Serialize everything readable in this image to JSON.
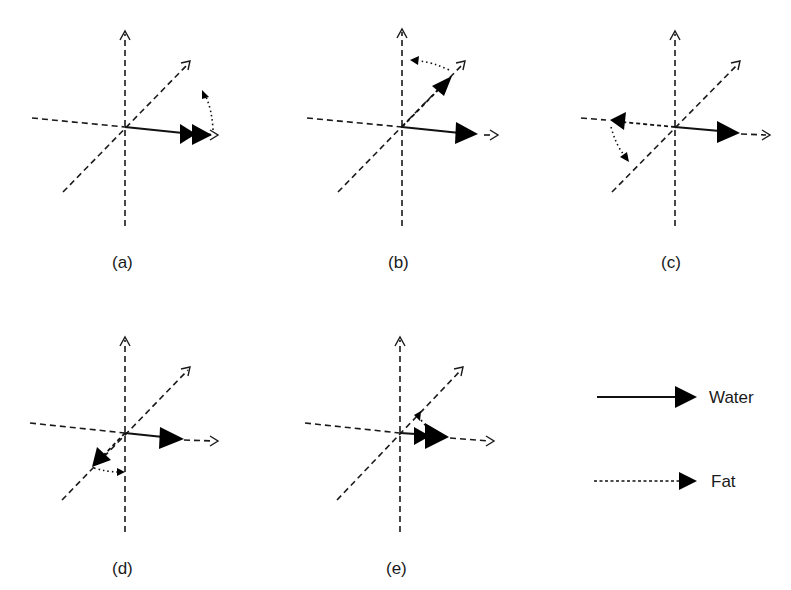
{
  "figure": {
    "panels": [
      {
        "id": "a",
        "label": "(a)"
      },
      {
        "id": "b",
        "label": "(b)"
      },
      {
        "id": "c",
        "label": "(c)"
      },
      {
        "id": "d",
        "label": "(d)"
      },
      {
        "id": "e",
        "label": "(e)"
      }
    ],
    "legend": {
      "items": [
        {
          "name": "water",
          "label": "Water",
          "line_style": "solid"
        },
        {
          "name": "fat",
          "label": "Fat",
          "line_style": "dashed"
        }
      ]
    },
    "colors": {
      "background": "#ffffff",
      "ink": "#111111"
    }
  }
}
